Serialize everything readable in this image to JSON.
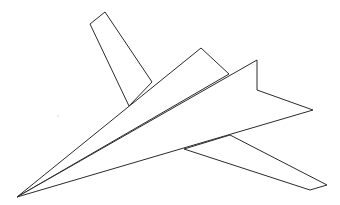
{
  "diagram": {
    "background": "#ffffff",
    "stroke_color": "#2b2b2b",
    "shapes": {
      "vertical_fin": [
        [
          90,
          24
        ],
        [
          105,
          12
        ],
        [
          152,
          82
        ],
        [
          129,
          106
        ]
      ],
      "lower_wing": [
        [
          184,
          149
        ],
        [
          310,
          190
        ],
        [
          327,
          185
        ],
        [
          230,
          135
        ]
      ],
      "upper_left_wing": [
        [
          17,
          197
        ],
        [
          201,
          48
        ],
        [
          229,
          74
        ]
      ],
      "right_wing": [
        [
          17,
          197
        ],
        [
          257,
          60
        ],
        [
          257,
          90
        ],
        [
          313,
          110
        ]
      ],
      "stray_dot": [
        58,
        116
      ]
    }
  }
}
